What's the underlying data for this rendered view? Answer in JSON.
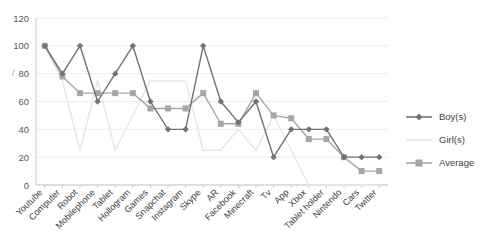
{
  "chart_data": {
    "type": "line",
    "title": "",
    "xlabel": "",
    "ylabel": "",
    "ylim": [
      0,
      120
    ],
    "ytick_step": 20,
    "yticks": [
      "0",
      "20",
      "40",
      "60",
      "80",
      "100",
      "120"
    ],
    "grid": true,
    "legend_position": "right",
    "categories": [
      "Youtube",
      "Computer",
      "Robot",
      "Mobilephone",
      "Tablet",
      "Hollogram",
      "Games",
      "Snapchat",
      "Instagram",
      "Skype",
      "AR",
      "Facebook",
      "Minecraft",
      "Tv",
      "App",
      "Xbox",
      "Tablet holder",
      "Nintendo",
      "Cars",
      "Twitter"
    ],
    "series": [
      {
        "name": "Boy(s)",
        "color": "#767171",
        "marker": "diamond",
        "values": [
          100,
          80,
          100,
          60,
          80,
          100,
          60,
          40,
          40,
          100,
          60,
          45,
          60,
          20,
          40,
          40,
          40,
          20,
          20,
          20
        ]
      },
      {
        "name": "Girl(s)",
        "color": "#e8e8e8",
        "marker": "none",
        "values": [
          100,
          75,
          25,
          75,
          25,
          50,
          75,
          75,
          75,
          25,
          25,
          40,
          25,
          50,
          25,
          0,
          0,
          0,
          0,
          0
        ]
      },
      {
        "name": "Average",
        "color": "#a6a6a6",
        "marker": "square",
        "values": [
          100,
          78,
          66,
          66,
          66,
          66,
          55,
          55,
          55,
          66,
          44,
          44,
          66,
          50,
          48,
          33,
          33,
          20,
          10,
          10
        ]
      }
    ],
    "stray_mark": "/"
  },
  "legend": {
    "items": [
      {
        "label": "Boy(s)"
      },
      {
        "label": "Girl(s)"
      },
      {
        "label": "Average"
      }
    ]
  }
}
